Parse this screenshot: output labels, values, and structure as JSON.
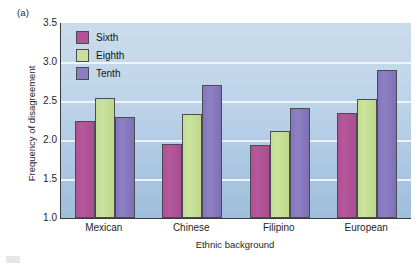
{
  "figure": {
    "panel_label": "(a)"
  },
  "chart_data": {
    "type": "bar",
    "title": "",
    "xlabel": "Ethnic background",
    "ylabel": "Frequency of disagreement",
    "categories": [
      "Mexican",
      "Chinese",
      "Filipino",
      "European"
    ],
    "series": [
      {
        "name": "Sixth",
        "color": "#b4539a",
        "values": [
          2.25,
          1.95,
          1.94,
          2.34
        ]
      },
      {
        "name": "Eighth",
        "color": "#c8e09a",
        "values": [
          2.54,
          2.33,
          2.11,
          2.52
        ]
      },
      {
        "name": "Tenth",
        "color": "#8b7ec1",
        "values": [
          2.3,
          2.71,
          2.41,
          2.9
        ]
      }
    ],
    "ylim": [
      1.0,
      3.5
    ],
    "ytick_values": [
      1.0,
      1.5,
      2.0,
      2.5,
      3.0,
      3.5
    ],
    "ytick_labels": [
      "1.0",
      "1.5",
      "2.0",
      "2.5",
      "3.0",
      "3.5"
    ],
    "grid": true,
    "legend_position": "top-left",
    "plot_background": "#b8cfe6"
  }
}
